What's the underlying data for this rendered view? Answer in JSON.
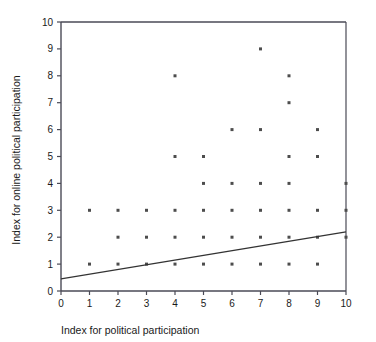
{
  "chart_data": {
    "type": "scatter",
    "title": "",
    "xlabel": "Index for political participation",
    "ylabel": "Index for online political participation",
    "xlim": [
      0,
      10
    ],
    "ylim": [
      0,
      10
    ],
    "xticks": [
      "0",
      "1",
      "2",
      "3",
      "4",
      "5",
      "6",
      "7",
      "8",
      "9",
      "10"
    ],
    "yticks": [
      "0",
      "1",
      "2",
      "3",
      "4",
      "5",
      "6",
      "7",
      "8",
      "9",
      "10"
    ],
    "grid": false,
    "legend": null,
    "marker": {
      "shape": "square",
      "color": "#4d4d4d",
      "size": 3
    },
    "points": [
      {
        "x": 1,
        "y": 1
      },
      {
        "x": 1,
        "y": 3
      },
      {
        "x": 2,
        "y": 1
      },
      {
        "x": 2,
        "y": 2
      },
      {
        "x": 2,
        "y": 3
      },
      {
        "x": 3,
        "y": 1
      },
      {
        "x": 3,
        "y": 2
      },
      {
        "x": 3,
        "y": 3
      },
      {
        "x": 4,
        "y": 1
      },
      {
        "x": 4,
        "y": 2
      },
      {
        "x": 4,
        "y": 3
      },
      {
        "x": 4,
        "y": 5
      },
      {
        "x": 4,
        "y": 8
      },
      {
        "x": 5,
        "y": 1
      },
      {
        "x": 5,
        "y": 2
      },
      {
        "x": 5,
        "y": 3
      },
      {
        "x": 5,
        "y": 4
      },
      {
        "x": 5,
        "y": 5
      },
      {
        "x": 6,
        "y": 1
      },
      {
        "x": 6,
        "y": 2
      },
      {
        "x": 6,
        "y": 3
      },
      {
        "x": 6,
        "y": 4
      },
      {
        "x": 6,
        "y": 6
      },
      {
        "x": 7,
        "y": 1
      },
      {
        "x": 7,
        "y": 2
      },
      {
        "x": 7,
        "y": 3
      },
      {
        "x": 7,
        "y": 4
      },
      {
        "x": 7,
        "y": 6
      },
      {
        "x": 7,
        "y": 9
      },
      {
        "x": 8,
        "y": 1
      },
      {
        "x": 8,
        "y": 2
      },
      {
        "x": 8,
        "y": 3
      },
      {
        "x": 8,
        "y": 4
      },
      {
        "x": 8,
        "y": 5
      },
      {
        "x": 8,
        "y": 7
      },
      {
        "x": 8,
        "y": 8
      },
      {
        "x": 9,
        "y": 1
      },
      {
        "x": 9,
        "y": 2
      },
      {
        "x": 9,
        "y": 3
      },
      {
        "x": 9,
        "y": 5
      },
      {
        "x": 9,
        "y": 6
      },
      {
        "x": 10,
        "y": 2
      },
      {
        "x": 10,
        "y": 3
      },
      {
        "x": 10,
        "y": 4
      }
    ],
    "trendline": {
      "name": "fit-line",
      "color": "#333333",
      "x0": 0,
      "y0": 0.45,
      "x1": 10,
      "y1": 2.2
    },
    "axis_color": "#4a4a56",
    "frame": {
      "top_border": true,
      "right_border": false,
      "left_border": true,
      "bottom_border": true
    }
  }
}
